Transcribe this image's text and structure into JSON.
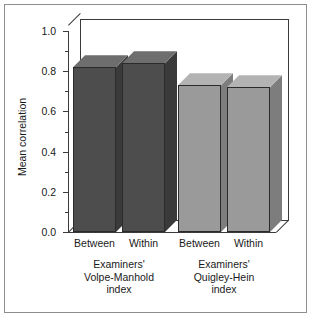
{
  "chart_data": {
    "type": "bar",
    "title": "",
    "xlabel": "",
    "ylabel": "Mean correlation",
    "ylim": [
      0.0,
      1.0
    ],
    "ytick_labels": [
      "0.0",
      "0.2",
      "0.4",
      "0.6",
      "0.8",
      "1.0"
    ],
    "ytick_values": [
      0.0,
      0.2,
      0.4,
      0.6,
      0.8,
      1.0
    ],
    "minor_tick_step": 0.1,
    "grid": false,
    "legend": "none",
    "style": "3d-bars",
    "categories": [
      "Between",
      "Within",
      "Between",
      "Within"
    ],
    "values": [
      0.82,
      0.84,
      0.73,
      0.72
    ],
    "bar_colors": [
      "#4d4d4d",
      "#4d4d4d",
      "#9a9a9a",
      "#9a9a9a"
    ],
    "bar_top_colors": [
      "#6e6e6e",
      "#6e6e6e",
      "#b3b3b3",
      "#b3b3b3"
    ],
    "bar_side_colors": [
      "#3a3a3a",
      "#3a3a3a",
      "#7d7d7d",
      "#7d7d7d"
    ],
    "groups": [
      {
        "lines": [
          "Examiners'",
          "Volpe-Manhold",
          "index"
        ],
        "category_indices": [
          0,
          1
        ]
      },
      {
        "lines": [
          "Examiners'",
          "Quigley-Hein",
          "index"
        ],
        "category_indices": [
          2,
          3
        ]
      }
    ],
    "series": [
      {
        "name": "Mean correlation",
        "points": [
          {
            "group": "Examiners' Volpe-Manhold index",
            "category": "Between",
            "value": 0.82
          },
          {
            "group": "Examiners' Volpe-Manhold index",
            "category": "Within",
            "value": 0.84
          },
          {
            "group": "Examiners' Quigley-Hein index",
            "category": "Between",
            "value": 0.73
          },
          {
            "group": "Examiners' Quigley-Hein index",
            "category": "Within",
            "value": 0.72
          }
        ]
      }
    ]
  },
  "figure": {
    "border_color": "#8d8d8d",
    "background": "#ffffff",
    "axis_color": "#3a3a3a"
  }
}
